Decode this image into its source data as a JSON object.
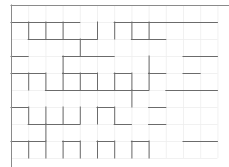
{
  "figure": {
    "type": "maze-grid",
    "background_color": "#ffffff",
    "width": 229,
    "height": 167
  },
  "grid": {
    "columns": 12,
    "rows": 9,
    "cell_width": 17.2,
    "cell_height": 17.0,
    "origin_x": 11,
    "origin_y": 5,
    "gridline_color": "#ededed",
    "gridline_width": 0.8,
    "gridline_visible": true
  },
  "walls": {
    "color": "#6b6b6b",
    "width": 1.0,
    "border_color": "#8a8a8a",
    "border_width": 1.0,
    "horizontal": [
      [
        0,
        0,
        12
      ],
      [
        0,
        9,
        12
      ],
      [
        1,
        0,
        1
      ],
      [
        1,
        1,
        2
      ],
      [
        1,
        3,
        1
      ],
      [
        1,
        6,
        1
      ],
      [
        1,
        7,
        2
      ],
      [
        1,
        9,
        1
      ],
      [
        1,
        10,
        1
      ],
      [
        1,
        11,
        1
      ],
      [
        2,
        1,
        2
      ],
      [
        2,
        2,
        3
      ],
      [
        2,
        4,
        1
      ],
      [
        2,
        7,
        1
      ],
      [
        2,
        8,
        1
      ],
      [
        3,
        0,
        1
      ],
      [
        3,
        3,
        2
      ],
      [
        3,
        5,
        1
      ],
      [
        3,
        10,
        2
      ],
      [
        4,
        0,
        2
      ],
      [
        4,
        3,
        1
      ],
      [
        4,
        4,
        1
      ],
      [
        4,
        6,
        1
      ],
      [
        4,
        8,
        1
      ],
      [
        4,
        10,
        1
      ],
      [
        5,
        2,
        2
      ],
      [
        5,
        4,
        2
      ],
      [
        5,
        6,
        1
      ],
      [
        5,
        7,
        1
      ],
      [
        5,
        9,
        1
      ],
      [
        5,
        10,
        2
      ],
      [
        6,
        0,
        1
      ],
      [
        6,
        5,
        1
      ],
      [
        6,
        8,
        1
      ],
      [
        7,
        1,
        2
      ],
      [
        7,
        3,
        1
      ],
      [
        7,
        6,
        1
      ],
      [
        7,
        8,
        1
      ],
      [
        8,
        0,
        2
      ],
      [
        8,
        3,
        1
      ],
      [
        8,
        5,
        1
      ],
      [
        8,
        7,
        1
      ],
      [
        8,
        10,
        2
      ]
    ],
    "vertical": [
      [
        0,
        0,
        9
      ],
      [
        0,
        12,
        9
      ],
      [
        0,
        4,
        1
      ],
      [
        0,
        7,
        1
      ],
      [
        0,
        9,
        1
      ],
      [
        0,
        11,
        1
      ],
      [
        1,
        1,
        1
      ],
      [
        1,
        4,
        1
      ],
      [
        1,
        6,
        1
      ],
      [
        1,
        8,
        1
      ],
      [
        1,
        10,
        1
      ],
      [
        2,
        1,
        1
      ],
      [
        2,
        4,
        1
      ],
      [
        2,
        6,
        1
      ],
      [
        2,
        7,
        1
      ],
      [
        2,
        8,
        1
      ],
      [
        3,
        1,
        1
      ],
      [
        3,
        3,
        1
      ],
      [
        3,
        4,
        1
      ],
      [
        3,
        6,
        1
      ],
      [
        3,
        8,
        1
      ],
      [
        3,
        11,
        1
      ],
      [
        4,
        2,
        1
      ],
      [
        4,
        4,
        1
      ],
      [
        4,
        6,
        1
      ],
      [
        4,
        8,
        1
      ],
      [
        4,
        11,
        1
      ],
      [
        5,
        1,
        1
      ],
      [
        5,
        4,
        1
      ],
      [
        5,
        6,
        1
      ],
      [
        5,
        8,
        1
      ],
      [
        6,
        1,
        1
      ],
      [
        6,
        4,
        1
      ],
      [
        6,
        6,
        1
      ],
      [
        6,
        8,
        1
      ],
      [
        7,
        1,
        1
      ],
      [
        7,
        4,
        1
      ],
      [
        7,
        5,
        1
      ],
      [
        7,
        8,
        1
      ],
      [
        8,
        1,
        1
      ],
      [
        8,
        3,
        1
      ],
      [
        8,
        4,
        1
      ],
      [
        8,
        8,
        1
      ],
      [
        8,
        10,
        1
      ]
    ]
  }
}
